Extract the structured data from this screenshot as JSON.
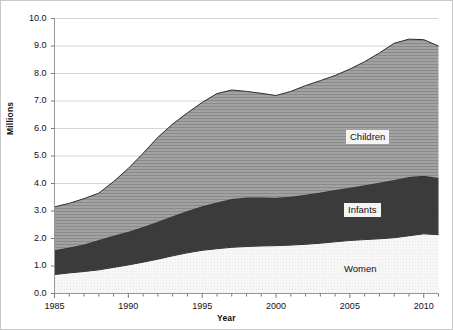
{
  "chart_data": {
    "type": "area",
    "stacked": true,
    "title": "",
    "subtitle": "",
    "xlabel": "Year",
    "ylabel": "Millions",
    "xlim": [
      1985,
      2011
    ],
    "ylim": [
      0.0,
      10.0
    ],
    "grid": true,
    "legend_position": "inline-labels",
    "x": [
      1985,
      1986,
      1987,
      1988,
      1989,
      1990,
      1991,
      1992,
      1993,
      1994,
      1995,
      1996,
      1997,
      1998,
      1999,
      2000,
      2001,
      2002,
      2003,
      2004,
      2005,
      2006,
      2007,
      2008,
      2009,
      2010,
      2011
    ],
    "xtick_labels": [
      "1985",
      "1990",
      "1995",
      "2000",
      "2005",
      "2010"
    ],
    "xtick_values": [
      1985,
      1990,
      1995,
      2000,
      2005,
      2010
    ],
    "ytick_labels": [
      "0.0",
      "1.0",
      "2.0",
      "3.0",
      "4.0",
      "5.0",
      "6.0",
      "7.0",
      "8.0",
      "9.0",
      "10.0"
    ],
    "ytick_values": [
      0.0,
      1.0,
      2.0,
      3.0,
      4.0,
      5.0,
      6.0,
      7.0,
      8.0,
      9.0,
      10.0
    ],
    "series": [
      {
        "name": "Women",
        "fill": "#f6f6f6",
        "pattern": "fine-dot",
        "values": [
          0.69,
          0.75,
          0.8,
          0.86,
          0.95,
          1.04,
          1.14,
          1.25,
          1.37,
          1.48,
          1.57,
          1.63,
          1.68,
          1.71,
          1.73,
          1.74,
          1.76,
          1.79,
          1.83,
          1.88,
          1.93,
          1.96,
          1.99,
          2.03,
          2.1,
          2.17,
          2.14
        ]
      },
      {
        "name": "Infants",
        "fill": "#3a3a3a",
        "pattern": "solid",
        "values": [
          0.88,
          0.92,
          0.98,
          1.09,
          1.15,
          1.21,
          1.28,
          1.36,
          1.44,
          1.52,
          1.6,
          1.68,
          1.76,
          1.78,
          1.76,
          1.74,
          1.76,
          1.8,
          1.84,
          1.88,
          1.92,
          1.98,
          2.04,
          2.1,
          2.14,
          2.11,
          2.06
        ]
      },
      {
        "name": "Children",
        "fill": "#9a9a9a",
        "pattern": "horizontal-lines",
        "values": [
          1.58,
          1.61,
          1.67,
          1.7,
          1.97,
          2.3,
          2.68,
          3.07,
          3.35,
          3.57,
          3.78,
          3.96,
          3.96,
          3.86,
          3.79,
          3.72,
          3.83,
          3.97,
          4.07,
          4.17,
          4.31,
          4.49,
          4.72,
          4.97,
          5.01,
          4.95,
          4.8
        ]
      }
    ],
    "totals": [
      3.15,
      3.28,
      3.45,
      3.65,
      4.07,
      4.55,
      5.1,
      5.68,
      6.16,
      6.57,
      6.95,
      7.27,
      7.4,
      7.35,
      7.28,
      7.2,
      7.35,
      7.56,
      7.74,
      7.93,
      8.16,
      8.43,
      8.75,
      9.1,
      9.25,
      9.23,
      9.0
    ],
    "inline_labels": [
      {
        "text": "Children",
        "x_px": 345,
        "y_px": 129
      },
      {
        "text": "Infants",
        "x_px": 343,
        "y_px": 202
      },
      {
        "text": "Women",
        "x_px": 339,
        "y_px": 261
      }
    ]
  }
}
